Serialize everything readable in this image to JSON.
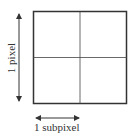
{
  "diagram": {
    "vertical_label": "1 pixel",
    "horizontal_label": "1 subpixel",
    "grid": {
      "rows": 2,
      "cols": 2
    },
    "colors": {
      "line": "#333333",
      "background": "#ffffff"
    }
  }
}
